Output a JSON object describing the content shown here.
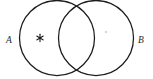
{
  "figure": {
    "kind": "venn-diagram",
    "background_color": "#ffffff",
    "stroke_color": "#1c1c1c",
    "width": 153,
    "height": 79
  },
  "sets": [
    {
      "id": "A",
      "label": "A",
      "label_x": 9,
      "label_y": 41,
      "center_x": 57,
      "center_y": 38,
      "radius": 37.5
    },
    {
      "id": "B",
      "label": "B",
      "label_x": 138,
      "label_y": 41,
      "center_x": 96,
      "center_y": 38,
      "radius": 37.5
    }
  ],
  "marks": [
    {
      "id": "star-mark-a",
      "glyph": "asterisk-mark",
      "region": "A-only",
      "x": 40,
      "y": 38,
      "color": "#1c1c1c",
      "size": 9
    },
    {
      "id": "faint-mark-b",
      "glyph": "dot-mark",
      "region": "B-only",
      "x": 106,
      "y": 32,
      "color": "#c9c9c9",
      "size": 2
    }
  ]
}
